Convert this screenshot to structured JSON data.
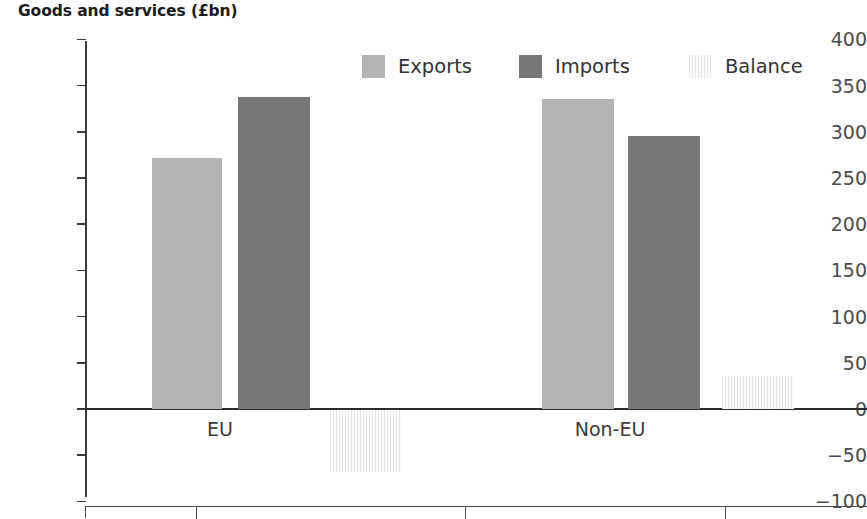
{
  "chart_data": {
    "type": "bar",
    "title": "Goods and services (£bn)",
    "xlabel": "",
    "ylabel": "",
    "ylim": [
      -100,
      400
    ],
    "grid": false,
    "legend_position": "top-center",
    "categories": [
      "EU",
      "Non-EU"
    ],
    "series": [
      {
        "name": "Exports",
        "color": "#b4b4b4",
        "values": [
          272,
          336
        ]
      },
      {
        "name": "Imports",
        "color": "#777777",
        "values": [
          338,
          295
        ]
      },
      {
        "name": "Balance",
        "color": "#f2f2f2",
        "values": [
          -68,
          36
        ]
      }
    ],
    "yticks": [
      400,
      350,
      300,
      250,
      200,
      150,
      100,
      50,
      0,
      -50,
      -100
    ],
    "ytick_labels": [
      "400",
      "350",
      "300",
      "250",
      "200",
      "150",
      "100",
      "50",
      "0",
      "−50",
      "−100"
    ]
  },
  "legend": {
    "items": [
      {
        "label": "Exports"
      },
      {
        "label": "Imports"
      },
      {
        "label": "Balance"
      }
    ]
  },
  "axis": {
    "category_labels": [
      "EU",
      "Non-EU"
    ]
  },
  "table_fragment": {
    "column_divider_count": 3
  }
}
